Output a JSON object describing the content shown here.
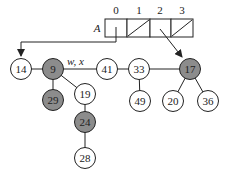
{
  "array": {
    "name": "A",
    "indices": [
      "0",
      "1",
      "2",
      "3"
    ],
    "cells": [
      {
        "index": "0",
        "content": "pointer",
        "points_to": "14"
      },
      {
        "index": "1",
        "content": "nil"
      },
      {
        "index": "2",
        "content": "pointer",
        "points_to": "17"
      },
      {
        "index": "3",
        "content": "nil"
      }
    ]
  },
  "pointer_label": "w, x",
  "colors": {
    "shaded_node": "#8c8c8c",
    "white_node": "#ffffff",
    "stroke": "#222222"
  },
  "nodes": [
    {
      "id": "n14",
      "label": "14",
      "shaded": false
    },
    {
      "id": "n9",
      "label": "9",
      "shaded": true
    },
    {
      "id": "n41",
      "label": "41",
      "shaded": false
    },
    {
      "id": "n33",
      "label": "33",
      "shaded": false
    },
    {
      "id": "n17",
      "label": "17",
      "shaded": true
    },
    {
      "id": "n29",
      "label": "29",
      "shaded": true
    },
    {
      "id": "n19",
      "label": "19",
      "shaded": false
    },
    {
      "id": "n24",
      "label": "24",
      "shaded": true
    },
    {
      "id": "n28",
      "label": "28",
      "shaded": false
    },
    {
      "id": "n49",
      "label": "49",
      "shaded": false
    },
    {
      "id": "n20",
      "label": "20",
      "shaded": false
    },
    {
      "id": "n36",
      "label": "36",
      "shaded": false
    }
  ],
  "edges": [
    [
      "14",
      "9"
    ],
    [
      "9",
      "41"
    ],
    [
      "41",
      "33"
    ],
    [
      "33",
      "17"
    ],
    [
      "9",
      "29"
    ],
    [
      "9",
      "19"
    ],
    [
      "19",
      "24"
    ],
    [
      "24",
      "28"
    ],
    [
      "33",
      "49"
    ],
    [
      "17",
      "20"
    ],
    [
      "17",
      "36"
    ]
  ]
}
